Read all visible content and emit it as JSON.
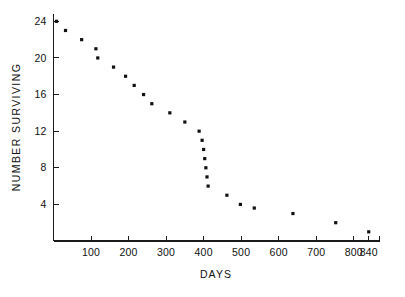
{
  "chart_data": {
    "type": "scatter",
    "title": "",
    "subtitle": "",
    "xlabel": "DAYS",
    "ylabel": "NUMBER SURVIVING",
    "xlim": [
      0,
      870
    ],
    "ylim": [
      0,
      24.8
    ],
    "grid": false,
    "legend": null,
    "marker": "filled-square",
    "marker_color": "#111111",
    "xticks": [
      100,
      200,
      300,
      400,
      500,
      600,
      700,
      800,
      840
    ],
    "xtick_labels": [
      "100",
      "200",
      "300",
      "400",
      "500",
      "600",
      "700",
      "800",
      "840"
    ],
    "yticks": [
      4,
      8,
      12,
      16,
      20,
      24
    ],
    "ytick_labels": [
      "4",
      "8",
      "12",
      "16",
      "20",
      "24"
    ],
    "series": [
      {
        "name": "Number surviving",
        "x": [
          8,
          32,
          75,
          113,
          118,
          160,
          192,
          215,
          240,
          262,
          310,
          350,
          388,
          396,
          400,
          403,
          406,
          409,
          412,
          462,
          498,
          535,
          638,
          752,
          840
        ],
        "y": [
          24,
          23,
          22,
          21,
          20,
          19,
          18,
          17,
          16,
          15,
          14,
          13,
          12,
          11,
          10,
          9,
          8,
          7,
          6,
          5,
          4,
          3.6,
          3,
          2,
          1
        ]
      }
    ]
  },
  "axis": {
    "x_title": "DAYS",
    "y_title": "NUMBER  SURVIVING"
  }
}
